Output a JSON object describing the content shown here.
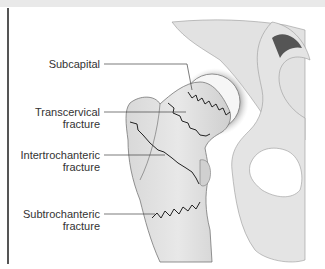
{
  "diagram": {
    "labels": [
      {
        "id": "subcapital",
        "lines": [
          "Subcapital"
        ]
      },
      {
        "id": "transcervical",
        "lines": [
          "Transcervical",
          "fracture"
        ]
      },
      {
        "id": "intertrochanteric",
        "lines": [
          "Intertrochanteric",
          "fracture"
        ]
      },
      {
        "id": "subtrochanteric",
        "lines": [
          "Subtrochanteric",
          "fracture"
        ]
      }
    ]
  }
}
